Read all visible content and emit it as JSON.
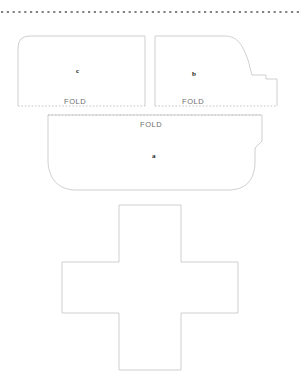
{
  "document": {
    "title": "Papercraft Fold Template",
    "background_color": "#ffffff",
    "width": 300,
    "height": 384
  },
  "colors": {
    "cut_line": "#c9cacc",
    "fold_line": "#bcbdc0",
    "perforation": "#808285",
    "fold_text": "#6d6e71",
    "panel_text": "#231f20",
    "paper": "#ffffff"
  },
  "top_border": {
    "name": "perforated-edge",
    "style": "dotted",
    "y": 12
  },
  "fold_lines": [
    {
      "id": "fold-c",
      "label": "FOLD",
      "y": 106,
      "x1": 18,
      "x2": 145
    },
    {
      "id": "fold-b",
      "label": "FOLD",
      "y": 106,
      "x1": 155,
      "x2": 277
    },
    {
      "id": "fold-a",
      "label": "FOLD",
      "y": 115,
      "x1": 48,
      "x2": 262
    }
  ],
  "panels": [
    {
      "id": "panel-c",
      "label": "c",
      "fold_label": "FOLD",
      "description": "left upper panel with rounded top-left corner"
    },
    {
      "id": "panel-b",
      "label": "b",
      "fold_label": "FOLD",
      "description": "right upper panel with curved shoulder and stepped right edge"
    },
    {
      "id": "panel-a",
      "label": "a",
      "fold_label": "FOLD",
      "description": "large lower hull panel with rounded bottom and stepped right edge"
    },
    {
      "id": "panel-cross",
      "label": "",
      "fold_label": "",
      "description": "plus shaped base piece"
    }
  ],
  "labels": {
    "fold": "FOLD",
    "panel_c": "c",
    "panel_b": "b",
    "panel_a": "a"
  }
}
